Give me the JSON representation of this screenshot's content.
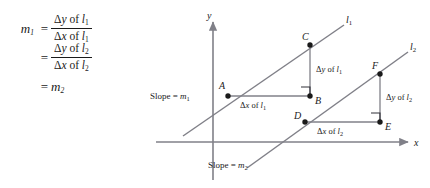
{
  "formula": {
    "lhs": "m",
    "lhs_sub": "1",
    "equals": "=",
    "line1": {
      "numerator_delta": "Δ",
      "numerator_var": "y",
      "numerator_of": " of ",
      "numerator_line": "l",
      "numerator_sub": "1",
      "denominator_delta": "Δ",
      "denominator_var": "x",
      "denominator_of": " of ",
      "denominator_line": "l",
      "denominator_sub": "1"
    },
    "line2": {
      "numerator_delta": "Δ",
      "numerator_var": "y",
      "numerator_of": " of ",
      "numerator_line": "l",
      "numerator_sub": "2",
      "denominator_delta": "Δ",
      "denominator_var": "x",
      "denominator_of": " of ",
      "denominator_line": "l",
      "denominator_sub": "2"
    },
    "line3": {
      "result": "m",
      "result_sub": "2"
    }
  },
  "diagram": {
    "axis_x_label": "x",
    "axis_y_label": "y",
    "line1_label": "l",
    "line1_label_sub": "1",
    "line2_label": "l",
    "line2_label_sub": "2",
    "slope1_text": "Slope = ",
    "slope1_var": "m",
    "slope1_sub": "1",
    "slope2_text": "Slope = ",
    "slope2_var": "m",
    "slope2_sub": "2",
    "point_a": "A",
    "point_b": "B",
    "point_c": "C",
    "point_d": "D",
    "point_e": "E",
    "point_f": "F",
    "dy1_delta": "Δ",
    "dy1_var": "y",
    "dy1_of": " of ",
    "dy1_line": "l",
    "dy1_sub": "1",
    "dx1_delta": "Δ",
    "dx1_var": "x",
    "dx1_of": " of ",
    "dx1_line": "l",
    "dx1_sub": "1",
    "dy2_delta": "Δ",
    "dy2_var": "y",
    "dy2_of": " of ",
    "dy2_line": "l",
    "dy2_sub": "2",
    "dx2_delta": "Δ",
    "dx2_var": "x",
    "dx2_of": " of ",
    "dx2_line": "l",
    "dx2_sub": "2"
  },
  "colors": {
    "ink": "#1a1a1a",
    "line": "#808088",
    "axis": "#808088",
    "background": "#ffffff"
  }
}
